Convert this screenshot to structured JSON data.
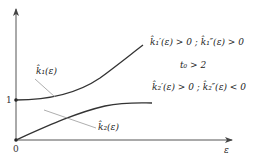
{
  "diagram": {
    "axes": {
      "x_axis_label": "ε",
      "origin_label": "0",
      "y_tick_label": "1"
    },
    "curves": [
      {
        "id": "k1",
        "label": "k̂₁(ε)",
        "shape": "convex-increasing",
        "start_y_value": 1,
        "condition": "k̂₁′(ε) > 0 ; k̂₁″(ε) > 0"
      },
      {
        "id": "k2",
        "label": "k̂₂(ε)",
        "shape": "concave-increasing",
        "start_y_value": 0,
        "condition": "k̂₂′(ε) > 0 ; k̂₂″(ε) < 0"
      }
    ],
    "parameter_note": "t₀ > 2",
    "colors": {
      "curve": "#333333",
      "axis": "#555555",
      "leader": "#999999"
    }
  }
}
